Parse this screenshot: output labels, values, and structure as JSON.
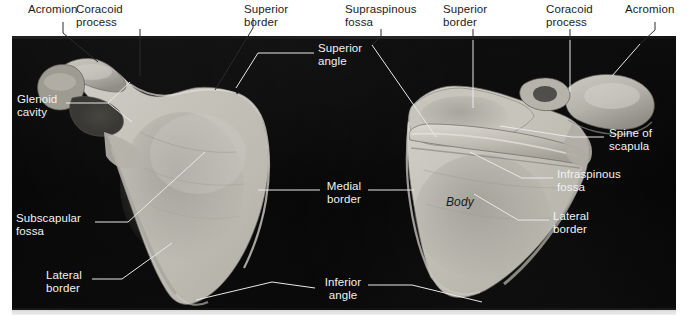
{
  "figure": {
    "subject": "scapula",
    "background_color": "#ffffff",
    "photo_background_color": "#070707",
    "bone_color": "#c9c6bf",
    "leader_line_color_dark_bg": "#e8e8e8",
    "leader_line_color_light_bg": "#2a2a2a",
    "label_color_light_bg": "#1b1b1b",
    "label_color_dark_bg": "#f2f2f2"
  },
  "labels": {
    "acromion_left": "Acromion",
    "coracoid_process_left": "Coracoid\nprocess",
    "superior_border_left": "Superior\nborder",
    "superior_angle": "Superior\nangle",
    "supraspinous_fossa": "Supraspinous\nfossa",
    "superior_border_right": "Superior\nborder",
    "coracoid_process_right": "Coracoid\nprocess",
    "acromion_right": "Acromion",
    "glenoid_cavity": "Glenoid\ncavity",
    "spine_of_scapula": "Spine of\nscapula",
    "infraspinous_fossa": "Infraspinous\nfossa",
    "medial_border": "Medial\nborder",
    "lateral_border_right": "Lateral\nborder",
    "subscapular_fossa": "Subscapular\nfossa",
    "lateral_border_left": "Lateral\nborder",
    "inferior_angle": "Inferior\nangle",
    "body": "Body"
  }
}
